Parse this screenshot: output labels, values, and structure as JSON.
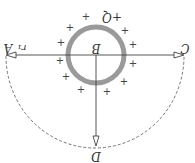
{
  "diagram": {
    "orientation": "rotated-180",
    "labels": {
      "A": "A",
      "B": "B",
      "C": "C",
      "D": "D",
      "Q": "+Q",
      "r1": "r₁"
    },
    "plus_sign": "+",
    "colors": {
      "shell": "#9a9a9a",
      "lines": "#444444",
      "dashed_arc": "#666666",
      "text": "#333333"
    }
  }
}
